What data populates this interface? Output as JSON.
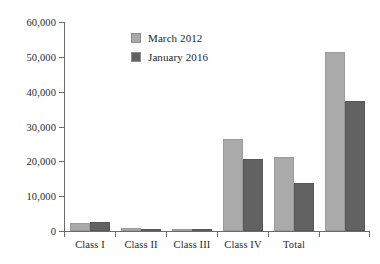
{
  "chart_data": {
    "type": "bar",
    "title": "",
    "subtitle": "",
    "xlabel": "",
    "ylabel": "",
    "categories": [
      "Class I",
      "Class II",
      "Class III",
      "Class IV",
      "Total",
      ""
    ],
    "series": [
      {
        "name": "March 2012",
        "color": "#aaaaaa",
        "values": [
          2400,
          1000,
          200,
          26400,
          21300,
          51500
        ]
      },
      {
        "name": "January 2016",
        "color": "#626262",
        "values": [
          2600,
          600,
          100,
          20700,
          13800,
          37400
        ]
      }
    ],
    "ylim": [
      0,
      60000
    ],
    "ytick_values": [
      0,
      10000,
      20000,
      30000,
      40000,
      50000,
      60000
    ],
    "ytick_labels": [
      "0",
      "10,000",
      "20,000",
      "30,000",
      "40,000",
      "50,000",
      "60,000"
    ],
    "grid": false,
    "legend_position": "top-center"
  },
  "legend": {
    "entries": [
      {
        "label": "March 2012"
      },
      {
        "label": "January 2016"
      }
    ]
  }
}
